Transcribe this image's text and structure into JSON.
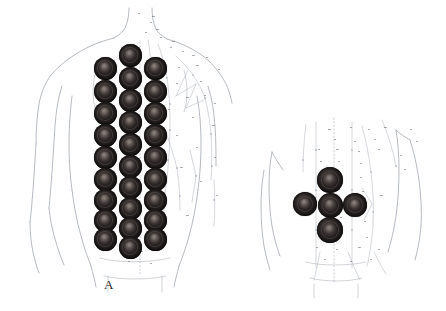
{
  "figure": {
    "type": "anatomical-illustration",
    "background_color": "#ffffff",
    "outline_color": "#9aa0a8",
    "meridian_line_color": "#aab0b8",
    "cup_mark_color": "#241f1f",
    "caption_color": "#2b2b2b"
  },
  "panels": [
    {
      "id": "panel-a",
      "caption": "A",
      "caption_position": {
        "x": 112,
        "y": 285
      },
      "description": "Full posterior torso with three vertical columns of cupping marks along the back",
      "body_view": "posterior full back, head and arms",
      "cup_columns": [
        {
          "name": "left-column",
          "center_x": 105,
          "count": 9,
          "radius": 11.5,
          "y_positions": [
            68,
            91,
            113,
            135,
            157,
            179,
            200,
            220,
            239
          ]
        },
        {
          "name": "middle-column",
          "center_x": 130,
          "count": 10,
          "radius": 11.5,
          "y_positions": [
            55,
            78,
            100,
            122,
            144,
            166,
            187,
            208,
            228,
            247
          ]
        },
        {
          "name": "right-column",
          "center_x": 155,
          "count": 9,
          "radius": 11.5,
          "y_positions": [
            68,
            91,
            113,
            135,
            157,
            179,
            200,
            220,
            239
          ]
        }
      ],
      "total_cups": 28
    },
    {
      "id": "panel-b",
      "caption": "B",
      "caption_position": {
        "x": 310,
        "y": 285
      },
      "description": "Partial back / lumbar region with five cupping marks in a plus formation",
      "body_view": "posterior lower back detail",
      "cups": [
        {
          "name": "top-cup",
          "x": 330,
          "y": 180,
          "radius": 13
        },
        {
          "name": "left-cup",
          "x": 305,
          "y": 204,
          "radius": 12
        },
        {
          "name": "center-cup",
          "x": 330,
          "y": 205,
          "radius": 12.5
        },
        {
          "name": "right-cup",
          "x": 355,
          "y": 205,
          "radius": 12
        },
        {
          "name": "bottom-cup",
          "x": 330,
          "y": 230,
          "radius": 13
        }
      ],
      "total_cups": 5
    }
  ],
  "annotation_labels": {
    "note": "acupuncture point labels rendered at sub-pixel size, illegible in source",
    "sample_glyphs": [
      "••",
      "•••",
      "••",
      "••••",
      "••",
      "•••"
    ]
  }
}
